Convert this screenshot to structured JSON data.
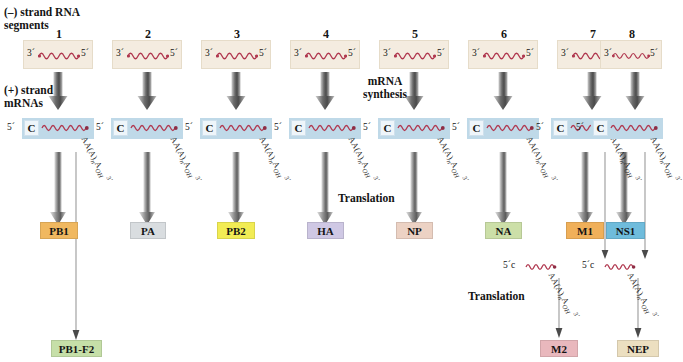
{
  "diagram": {
    "labels": {
      "vrna_caption": "(–) strand RNA\nsegments",
      "mrna_caption": "(+) strand\nmRNAs",
      "mrna_synthesis": "mRNA\nsynthesis",
      "translation": "Translation",
      "translation2": "Translation"
    },
    "notation": {
      "three_prime": "3´",
      "five_prime": "5´",
      "cap": "C",
      "cap_small": "c",
      "polya": "AA(A)nAOH 3´",
      "polya_prefix": "AA(A)",
      "polya_sub": "n",
      "polya_suffix": "AOH",
      "polya_end": "3´"
    },
    "segments": [
      {
        "number": "1",
        "left_end": "3´",
        "right_end": "5´"
      },
      {
        "number": "2",
        "left_end": "3´",
        "right_end": "5´"
      },
      {
        "number": "3",
        "left_end": "3´",
        "right_end": "5´"
      },
      {
        "number": "4",
        "left_end": "3´",
        "right_end": "5´"
      },
      {
        "number": "5",
        "left_end": "3´",
        "right_end": "5´"
      },
      {
        "number": "6",
        "left_end": "3´",
        "right_end": "5´"
      },
      {
        "number": "7",
        "left_end": "3´",
        "right_end": "5´"
      },
      {
        "number": "8",
        "left_end": "3´",
        "right_end": "5´"
      }
    ],
    "proteins": [
      {
        "name": "PB1",
        "color": "#f0b860",
        "segment": "1"
      },
      {
        "name": "PA",
        "color": "#d9dde0",
        "segment": "2"
      },
      {
        "name": "PB2",
        "color": "#f2ec54",
        "segment": "3"
      },
      {
        "name": "HA",
        "color": "#cfc8e4",
        "segment": "4"
      },
      {
        "name": "NP",
        "color": "#ecd2c4",
        "segment": "5"
      },
      {
        "name": "NA",
        "color": "#ccdfa8",
        "segment": "6"
      },
      {
        "name": "M1",
        "color": "#f0b05a",
        "segment": "7"
      },
      {
        "name": "NS1",
        "color": "#6fbcdc",
        "segment": "8"
      }
    ],
    "secondary_proteins": [
      {
        "name": "PB1-F2",
        "color": "#c6dfa8",
        "from": "1"
      },
      {
        "name": "M2",
        "color": "#e9b8bd",
        "from": "7"
      },
      {
        "name": "NEP",
        "color": "#ecdfc0",
        "from": "8"
      }
    ],
    "colors": {
      "segment_box": "#f4ece0",
      "mrna_box": "#bfd9e8",
      "rna_strand": "#b0384f",
      "arrow_dark": "#4a4a4a",
      "arrow_light": "#d8d8d8",
      "thin_line": "#8d8d8d",
      "background": "#ffffff"
    }
  }
}
